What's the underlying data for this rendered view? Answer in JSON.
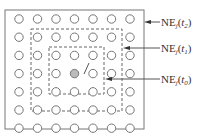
{
  "diagram": {
    "grid": {
      "rows": 7,
      "cols": 7,
      "center": [
        3,
        3
      ]
    },
    "colors": {
      "line": "#666666",
      "circle": "#777777",
      "center_fill": "#bbbbbb"
    },
    "labels": [
      {
        "base": "NE",
        "sub": "j",
        "arg": "t",
        "arg_sub": "2",
        "full": "NE_j(t2)"
      },
      {
        "base": "NE",
        "sub": "j",
        "arg": "t",
        "arg_sub": "1",
        "full": "NE_j(t1)"
      },
      {
        "base": "NE",
        "sub": "j",
        "arg": "t",
        "arg_sub": "0",
        "full": "NE_j(t0)"
      }
    ]
  }
}
